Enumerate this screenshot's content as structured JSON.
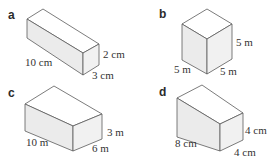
{
  "figure": {
    "panels": [
      {
        "letter": "a",
        "shape": "cuboid",
        "dimensions": {
          "length": "10 cm",
          "height": "2 cm",
          "width": "3 cm"
        }
      },
      {
        "letter": "b",
        "shape": "cube",
        "dimensions": {
          "left": "5 m",
          "height": "5 m",
          "right": "5 m"
        }
      },
      {
        "letter": "c",
        "shape": "cuboid",
        "dimensions": {
          "length": "10 m",
          "height": "3 m",
          "width": "6 m"
        }
      },
      {
        "letter": "d",
        "shape": "cuboid",
        "dimensions": {
          "length": "8 cm",
          "height": "4 cm",
          "width": "4 cm"
        }
      }
    ],
    "colors": {
      "edge": "#5a5a5a",
      "top_face": "#ffffff",
      "left_face": "#ebebeb",
      "right_face": "#f1f1f1"
    }
  }
}
